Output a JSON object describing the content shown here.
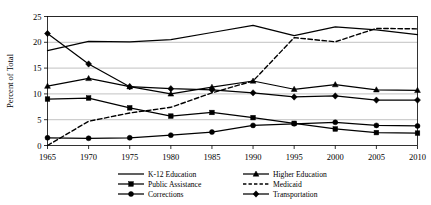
{
  "chart_data": {
    "type": "line",
    "title": "",
    "xlabel": "",
    "ylabel": "Percent of Total",
    "xlim": [
      1965,
      2010
    ],
    "ylim": [
      0,
      25
    ],
    "yticks": [
      0,
      5,
      10,
      15,
      20,
      25
    ],
    "grid": "horizontal",
    "legend_position": "bottom",
    "x": [
      1965,
      1970,
      1975,
      1980,
      1985,
      1990,
      1995,
      2000,
      2005,
      2010
    ],
    "xtick_labels": [
      "1965",
      "1970",
      "1975",
      "1980",
      "1985",
      "1990",
      "1995",
      "2000",
      "2005",
      "2010"
    ],
    "ytick_labels": [
      "0",
      "5",
      "10",
      "15",
      "20",
      "25"
    ],
    "series": [
      {
        "name": "K-12 Education",
        "marker": "none",
        "style": "solid",
        "values": [
          18.4,
          20.2,
          20.1,
          20.5,
          21.9,
          23.3,
          21.3,
          23.0,
          22.4,
          21.5
        ]
      },
      {
        "name": "Higher Education",
        "marker": "triangle",
        "style": "solid",
        "values": [
          11.5,
          13.0,
          11.4,
          10.0,
          11.3,
          12.5,
          10.9,
          11.8,
          10.8,
          10.7
        ]
      },
      {
        "name": "Public Assistance",
        "marker": "square",
        "style": "solid",
        "values": [
          9.0,
          9.2,
          7.3,
          5.7,
          6.4,
          5.4,
          4.3,
          3.2,
          2.5,
          2.4
        ]
      },
      {
        "name": "Medicaid",
        "marker": "none",
        "style": "dashed",
        "values": [
          0.0,
          4.7,
          6.3,
          7.4,
          10.2,
          12.5,
          20.9,
          20.1,
          22.7,
          22.6
        ]
      },
      {
        "name": "Corrections",
        "marker": "circle",
        "style": "solid",
        "values": [
          1.5,
          1.4,
          1.5,
          2.0,
          2.6,
          3.9,
          4.2,
          4.5,
          3.9,
          3.8
        ]
      },
      {
        "name": "Transportation",
        "marker": "diamond",
        "style": "solid",
        "values": [
          21.7,
          15.8,
          11.4,
          11.0,
          10.8,
          10.2,
          9.4,
          9.6,
          8.8,
          8.8
        ]
      }
    ],
    "legend_entries": [
      {
        "name": "K-12 Education",
        "marker": "none",
        "style": "solid"
      },
      {
        "name": "Higher Education",
        "marker": "triangle",
        "style": "solid"
      },
      {
        "name": "Public Assistance",
        "marker": "square",
        "style": "solid"
      },
      {
        "name": "Medicaid",
        "marker": "none",
        "style": "dashed"
      },
      {
        "name": "Corrections",
        "marker": "circle",
        "style": "solid"
      },
      {
        "name": "Transportation",
        "marker": "diamond",
        "style": "solid"
      }
    ],
    "colors": {
      "line": "#000000",
      "grid": "#a8a8a8",
      "axis": "#000000",
      "background": "#ffffff"
    }
  }
}
